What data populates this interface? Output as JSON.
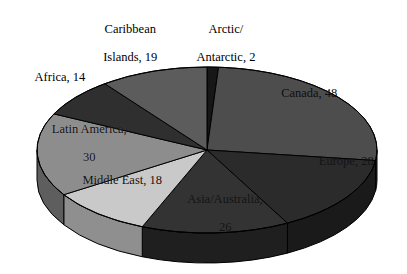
{
  "chart_data": {
    "type": "pie",
    "title": "",
    "subtitle": "",
    "xlabel": "",
    "ylabel": "",
    "legend_position": "none",
    "grid": false,
    "three_d": true,
    "total": 185,
    "categories": [
      "Canada",
      "Europe",
      "Asia/Australia",
      "Middle East",
      "Latin America",
      "Africa",
      "Caribbean Islands",
      "Arctic/Antarctic"
    ],
    "values": [
      48,
      28,
      26,
      18,
      30,
      14,
      19,
      2
    ],
    "slices": [
      {
        "name": "arctic-antarctic",
        "label_line1": "Arctic/",
        "label_line2": "Antarctic, 2",
        "label_text": "Arctic/ Antarctic, 2",
        "value": 2,
        "color": "#171717",
        "side_color": "#0d0d0d",
        "start_angle": 0,
        "end_angle": 3.89,
        "label_placement": "outside-top"
      },
      {
        "name": "canada",
        "label_line1": "Canada, 48",
        "label_line2": "",
        "label_text": "Canada, 48",
        "value": 48,
        "color": "#4d4d4d",
        "side_color": "#2e2e2e",
        "start_angle": 3.89,
        "end_angle": 97.3,
        "label_placement": "inside"
      },
      {
        "name": "europe",
        "label_line1": "Europe, 28",
        "label_line2": "",
        "label_text": "Europe, 28",
        "value": 28,
        "color": "#2b2b2b",
        "side_color": "#1a1a1a",
        "start_angle": 97.3,
        "end_angle": 151.78,
        "label_placement": "inside"
      },
      {
        "name": "asia-australia",
        "label_line1": "Asia/Australia,",
        "label_line2": "26",
        "label_text": "Asia/Australia, 26",
        "value": 26,
        "color": "#333333",
        "side_color": "#1f1f1f",
        "start_angle": 151.78,
        "end_angle": 202.38,
        "label_placement": "inside"
      },
      {
        "name": "middle-east",
        "label_line1": "Middle East, 18",
        "label_line2": "",
        "label_text": "Middle East, 18",
        "value": 18,
        "color": "#c9c9c9",
        "side_color": "#8f8f8f",
        "start_angle": 202.38,
        "end_angle": 237.41,
        "label_placement": "inside"
      },
      {
        "name": "latin-america",
        "label_line1": "Latin America,",
        "label_line2": "30",
        "label_text": "Latin America, 30",
        "value": 30,
        "color": "#8d8d8d",
        "side_color": "#5e5e5e",
        "start_angle": 237.41,
        "end_angle": 295.78,
        "label_placement": "inside"
      },
      {
        "name": "africa",
        "label_line1": "Africa, 14",
        "label_line2": "",
        "label_text": "Africa, 14",
        "value": 14,
        "color": "#2f2f2f",
        "side_color": "#1c1c1c",
        "start_angle": 295.78,
        "end_angle": 323.03,
        "label_placement": "outside-left"
      },
      {
        "name": "caribbean-islands",
        "label_line1": "Caribbean",
        "label_line2": "Islands, 19",
        "label_text": "Caribbean Islands, 19",
        "value": 19,
        "color": "#5c5c5c",
        "side_color": "#3a3a3a",
        "start_angle": 323.03,
        "end_angle": 360,
        "label_placement": "outside-top"
      }
    ]
  },
  "figure": {
    "background_color": "#ffffff",
    "outline_color": "#000000",
    "center_x": 207,
    "center_y": 150,
    "radius_x": 170,
    "radius_y": 83,
    "depth": 30
  }
}
